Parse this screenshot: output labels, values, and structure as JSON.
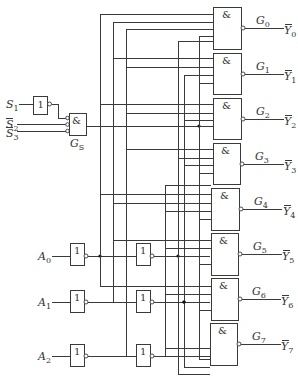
{
  "diagram": {
    "title": "",
    "type": "3-to-8 line decoder logic circuit",
    "enable": {
      "inputs": [
        {
          "name": "S",
          "sub": "1",
          "overline": false
        },
        {
          "name": "S",
          "sub": "2",
          "overline": true
        },
        {
          "name": "S",
          "sub": "3",
          "overline": true
        }
      ],
      "not_gate_symbol": "1",
      "and_gate_symbol": "&",
      "and_gate_label": {
        "name": "G",
        "sub": "S"
      }
    },
    "address_inputs": [
      {
        "name": "A",
        "sub": "0"
      },
      {
        "name": "A",
        "sub": "1"
      },
      {
        "name": "A",
        "sub": "2"
      }
    ],
    "inverter_symbol": "1",
    "nand_gate_symbol": "&",
    "outputs": [
      {
        "gate": "G",
        "gate_sub": "0",
        "out": "Y",
        "out_sub": "0"
      },
      {
        "gate": "G",
        "gate_sub": "1",
        "out": "Y",
        "out_sub": "1"
      },
      {
        "gate": "G",
        "gate_sub": "2",
        "out": "Y",
        "out_sub": "2"
      },
      {
        "gate": "G",
        "gate_sub": "3",
        "out": "Y",
        "out_sub": "3"
      },
      {
        "gate": "G",
        "gate_sub": "4",
        "out": "Y",
        "out_sub": "4"
      },
      {
        "gate": "G",
        "gate_sub": "5",
        "out": "Y",
        "out_sub": "5"
      },
      {
        "gate": "G",
        "gate_sub": "6",
        "out": "Y",
        "out_sub": "6"
      },
      {
        "gate": "G",
        "gate_sub": "7",
        "out": "Y",
        "out_sub": "7"
      }
    ],
    "colors": {
      "line": "#3a3a3a",
      "text": "#333333",
      "background": "#ffffff"
    }
  }
}
